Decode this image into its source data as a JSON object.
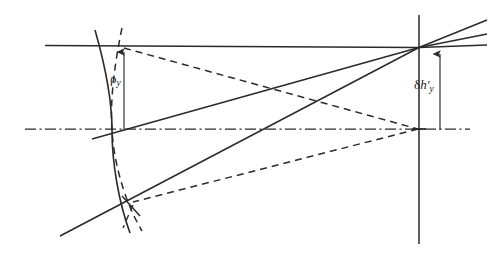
{
  "figure": {
    "name": "wavefront-aberration-diagram",
    "caption_text": "",
    "background_color": "#ffffff",
    "line_color": "#2a2a2a",
    "width": 488,
    "height": 254
  },
  "labels": {
    "pupil_coordinate": {
      "symbol": "ρ",
      "subscript": "y",
      "full_text": "ρy"
    },
    "transverse_aberration": {
      "symbol": "δ",
      "variable": "h",
      "prime": "′",
      "subscript": "y",
      "full_text": "δh′y"
    }
  },
  "geometry": {
    "optical_axis": {
      "name": "optical-axis",
      "style": "dash-dot",
      "y": 129,
      "x_start": 25,
      "x_end": 470
    },
    "image_plane": {
      "name": "image-plane-vertical-line",
      "style": "solid",
      "x": 419,
      "y_start": 15,
      "y_end": 244
    },
    "reference_sphere": {
      "name": "reference-sphere-curve",
      "style": "solid",
      "vertex_x": 112,
      "top": [
        95,
        30
      ],
      "bottom": [
        130,
        232
      ]
    },
    "wavefront": {
      "name": "aberrated-wavefront-curve",
      "style": "dashed",
      "vertex_x": 112,
      "top": [
        122,
        28
      ],
      "bottom": [
        142,
        230
      ]
    },
    "upper_chief_ray": {
      "name": "upper-marginal-ray-solid",
      "style": "solid",
      "from": [
        45,
        45
      ],
      "to": [
        419,
        47
      ]
    },
    "lower_marginal_ray": {
      "name": "lower-marginal-ray-solid",
      "style": "solid",
      "from": [
        60,
        236
      ],
      "to": [
        419,
        47
      ]
    },
    "upper_dashed_ray": {
      "name": "upper-aberrated-ray-dashed",
      "style": "dashed",
      "from": [
        124,
        48
      ],
      "to": [
        418,
        129
      ]
    },
    "lower_dashed_ray": {
      "name": "lower-aberrated-ray-dashed",
      "style": "dashed",
      "from": [
        135,
        203
      ],
      "to": [
        418,
        129
      ]
    },
    "axis_ray_solid": {
      "name": "axial-ray-solid",
      "style": "solid",
      "from": [
        112,
        129
      ],
      "to": [
        419,
        47
      ]
    },
    "fan_rays": {
      "name": "converging-ray-fan-upper-right",
      "count": 3,
      "origin": [
        419,
        47
      ]
    },
    "pupil_arrow": {
      "name": "pupil-coordinate-arrow",
      "x": 124,
      "y_tail": 129,
      "y_head": 50,
      "direction": "up"
    },
    "aberration_arrow": {
      "name": "aberration-height-arrow",
      "x": 440,
      "y_tail": 129,
      "y_head": 52,
      "direction": "up"
    }
  }
}
